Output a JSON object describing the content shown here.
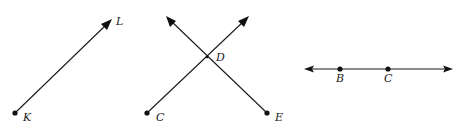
{
  "figures": [
    {
      "type": "ray",
      "name": "ray-KL",
      "points": [
        {
          "label": "K",
          "x": 15,
          "y": 113,
          "dot": true,
          "label_x": 23,
          "label_y": 121
        },
        {
          "label": "L",
          "x": 111,
          "y": 20,
          "dot": false,
          "label_x": 116,
          "label_y": 25
        }
      ],
      "arrow_at": "L"
    },
    {
      "type": "intersecting-rays",
      "name": "rays-CD-ED",
      "rays": [
        {
          "from": "C",
          "x1": 147,
          "y1": 113,
          "x2": 248,
          "y2": 17
        },
        {
          "from": "E",
          "x1": 267,
          "y1": 113,
          "x2": 167,
          "y2": 17
        }
      ],
      "points": [
        {
          "label": "C",
          "x": 147,
          "y": 113,
          "dot": true,
          "label_x": 156,
          "label_y": 121
        },
        {
          "label": "D",
          "x": 207,
          "y": 57,
          "dot": false,
          "label_x": 216,
          "label_y": 61
        },
        {
          "label": "E",
          "x": 267,
          "y": 113,
          "dot": true,
          "label_x": 275,
          "label_y": 121
        }
      ]
    },
    {
      "type": "line",
      "name": "line-BC",
      "x1": 305,
      "x2": 452,
      "y": 69,
      "points": [
        {
          "label": "B",
          "x": 340,
          "y": 69,
          "dot": true,
          "label_x": 336,
          "label_y": 82
        },
        {
          "label": "C",
          "x": 388,
          "y": 69,
          "dot": true,
          "label_x": 384,
          "label_y": 82
        }
      ]
    }
  ],
  "colors": {
    "stroke": "#1a1a1a",
    "background": "#ffffff"
  }
}
